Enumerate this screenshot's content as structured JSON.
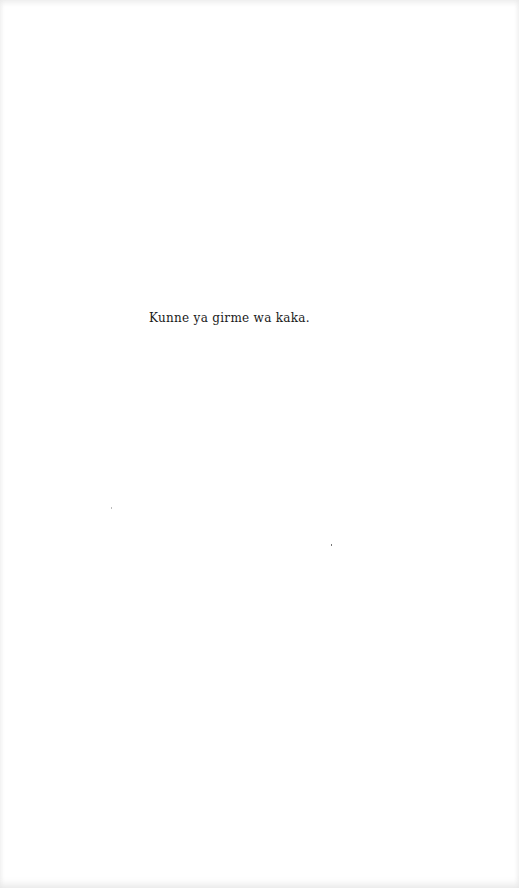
{
  "page": {
    "text_lines": [
      "Kunne ya girme wa kaka."
    ]
  }
}
